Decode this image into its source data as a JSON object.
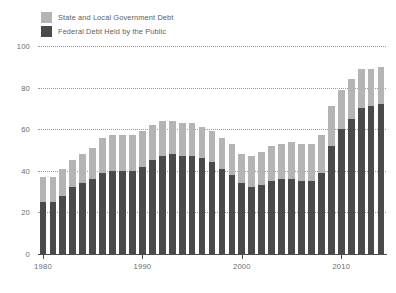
{
  "legend": {
    "items": [
      {
        "label": "State and Local Government Debt",
        "color": "#b4b4b4",
        "name": "state-local"
      },
      {
        "label": "Federal Debt Held by the Public",
        "color": "#4a4a4a",
        "name": "federal"
      }
    ]
  },
  "colors": {
    "state_local": "#b4b4b4",
    "federal": "#4a4a4a",
    "gridline": "#9a9a9a",
    "axis": "#4a4a4a",
    "tick_text": "#6b6b6b",
    "legend_text": "#5d5d5d",
    "background": "#ffffff"
  },
  "chart_data": {
    "type": "bar",
    "title": "",
    "subtitle": "",
    "xlabel": "",
    "ylabel": "",
    "stacked": true,
    "grid": true,
    "legend_position": "top-left",
    "ylim": [
      0,
      100
    ],
    "yticks": [
      0,
      20,
      40,
      60,
      80,
      100
    ],
    "ytick_labels": [
      "0",
      "20",
      "40",
      "60",
      "80",
      "100"
    ],
    "xticks": [
      1980,
      1990,
      2000,
      2010
    ],
    "xtick_labels": [
      "1980",
      "1990",
      "2000",
      "2010"
    ],
    "xlim": [
      1979.5,
      2014.5
    ],
    "categories": [
      1980,
      1981,
      1982,
      1983,
      1984,
      1985,
      1986,
      1987,
      1988,
      1989,
      1990,
      1991,
      1992,
      1993,
      1994,
      1995,
      1996,
      1997,
      1998,
      1999,
      2000,
      2001,
      2002,
      2003,
      2004,
      2005,
      2006,
      2007,
      2008,
      2009,
      2010,
      2011,
      2012,
      2013,
      2014
    ],
    "series": [
      {
        "name": "Federal Debt Held by the Public",
        "color": "#4a4a4a",
        "values": [
          25,
          25,
          28,
          32,
          34,
          36,
          39,
          40,
          40,
          40,
          42,
          45,
          47,
          48,
          47,
          47,
          46,
          44,
          41,
          38,
          34,
          32,
          33,
          35,
          36,
          36,
          35,
          35,
          39,
          52,
          60,
          65,
          70,
          71,
          72
        ]
      },
      {
        "name": "State and Local Government Debt",
        "color": "#b4b4b4",
        "values": [
          12,
          12,
          13,
          13,
          14,
          15,
          17,
          17,
          17,
          17,
          17,
          17,
          17,
          16,
          16,
          16,
          15,
          15,
          15,
          15,
          14,
          15,
          16,
          17,
          17,
          18,
          18,
          18,
          18,
          19,
          19,
          19,
          19,
          18,
          18
        ]
      }
    ],
    "totals": [
      37,
      37,
      41,
      45,
      48,
      51,
      56,
      57,
      57,
      57,
      59,
      62,
      64,
      64,
      63,
      63,
      61,
      59,
      56,
      53,
      48,
      47,
      49,
      52,
      53,
      54,
      53,
      53,
      57,
      71,
      79,
      84,
      89,
      89,
      90
    ]
  }
}
